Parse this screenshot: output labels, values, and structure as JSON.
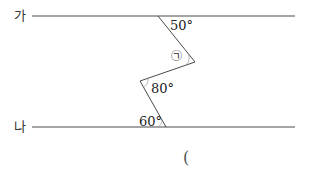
{
  "diagram": {
    "lines": {
      "top_label": "가",
      "bottom_label": "나"
    },
    "angles": {
      "top": "50°",
      "middle_unknown": "㉠",
      "middle": "80°",
      "bottom": "60°"
    },
    "answer_paren": "(",
    "colors": {
      "line": "#4a4a4a",
      "text": "#222222"
    }
  }
}
